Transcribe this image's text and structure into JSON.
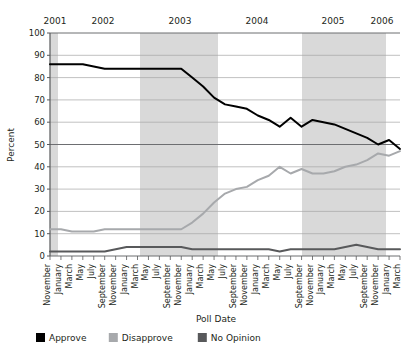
{
  "chart_data": {
    "type": "line",
    "title": "",
    "xlabel": "Poll Date",
    "ylabel": "Percent",
    "ylim": [
      0,
      100
    ],
    "ytick_step": 10,
    "yticks": [
      0,
      10,
      20,
      30,
      40,
      50,
      60,
      70,
      80,
      90,
      100
    ],
    "grid": true,
    "legend_position": "bottom",
    "year_labels": [
      "2001",
      "2002",
      "2003",
      "2004",
      "2005",
      "2006"
    ],
    "year_label_x": [
      55,
      103,
      180,
      257,
      333,
      382
    ],
    "shaded_bands": [
      {
        "x0": 50,
        "x1": 58
      },
      {
        "x0": 140,
        "x1": 218
      },
      {
        "x0": 302,
        "x1": 386
      }
    ],
    "x": [
      "November",
      "January",
      "March",
      "May",
      "July",
      "September",
      "November",
      "January",
      "March",
      "May",
      "July",
      "September",
      "November",
      "January",
      "March",
      "May",
      "July",
      "September",
      "November",
      "January",
      "March",
      "May",
      "July",
      "September",
      "November",
      "January",
      "March",
      "May",
      "July",
      "September",
      "November",
      "January",
      "March"
    ],
    "xtick_labels": [
      "November",
      "January",
      "March",
      "May",
      "July",
      "September",
      "November",
      "January",
      "March",
      "May",
      "July",
      "September",
      "November",
      "January",
      "March",
      "May",
      "July",
      "September",
      "November",
      "January",
      "March",
      "May",
      "July",
      "September",
      "November",
      "January",
      "March",
      "May",
      "July",
      "September",
      "November",
      "January",
      "March"
    ],
    "series": [
      {
        "name": "Approve",
        "color": "#000000",
        "values": [
          86,
          86,
          86,
          86,
          85,
          84,
          84,
          84,
          84,
          84,
          84,
          84,
          84,
          80,
          76,
          71,
          68,
          67,
          66,
          63,
          61,
          58,
          62,
          58,
          61,
          60,
          59,
          57,
          55,
          53,
          50,
          52,
          48
        ]
      },
      {
        "name": "Disapprove",
        "color": "#a7a9ac",
        "values": [
          12,
          12,
          11,
          11,
          11,
          12,
          12,
          12,
          12,
          12,
          12,
          12,
          12,
          15,
          19,
          24,
          28,
          30,
          31,
          34,
          36,
          40,
          37,
          39,
          37,
          37,
          38,
          40,
          41,
          43,
          46,
          45,
          47
        ]
      },
      {
        "name": "No Opinion",
        "color": "#58595b",
        "values": [
          2,
          2,
          2,
          2,
          2,
          2,
          3,
          4,
          4,
          4,
          4,
          4,
          4,
          3,
          3,
          3,
          3,
          3,
          3,
          3,
          3,
          2,
          3,
          3,
          3,
          3,
          3,
          4,
          5,
          4,
          3,
          3,
          3
        ]
      }
    ]
  },
  "legend": {
    "items": [
      {
        "label": "Approve",
        "color": "#000000"
      },
      {
        "label": "Disapprove",
        "color": "#a7a9ac"
      },
      {
        "label": "No Opinion",
        "color": "#58595b"
      }
    ]
  },
  "plot_geometry": {
    "left": 50,
    "right": 400,
    "top": 33,
    "bottom": 256
  },
  "colors": {
    "band": "#d9d9d9",
    "grid": "#a6a6a6",
    "axis": "#58595b",
    "text": "#231f20"
  }
}
